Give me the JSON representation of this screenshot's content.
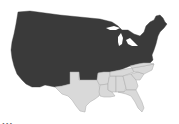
{
  "map": {
    "title": "United States map",
    "regions": [
      {
        "name": "Union / northern & western states",
        "color": "#3a3a3a"
      },
      {
        "name": "Southern states",
        "color": "#d9d9d9",
        "states": [
          "Texas",
          "Arkansas",
          "Louisiana",
          "Mississippi",
          "Alabama",
          "Tennessee",
          "Georgia",
          "Florida",
          "South Carolina",
          "North Carolina",
          "Virginia"
        ]
      }
    ]
  },
  "caption": {
    "text": "..."
  }
}
